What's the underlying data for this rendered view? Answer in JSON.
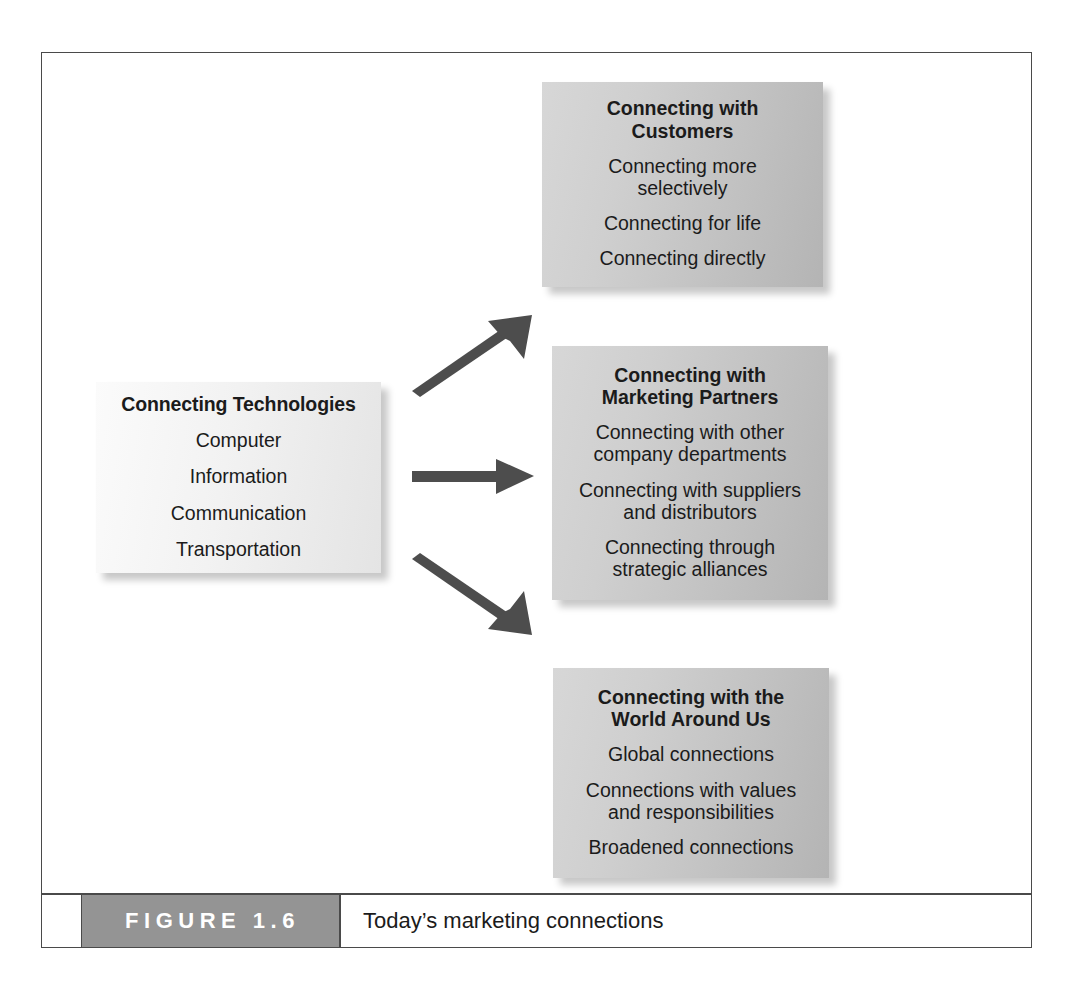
{
  "figure": {
    "badge_label": "FIGURE 1.6",
    "caption": "Today’s marketing connections",
    "badge_color": "#949494",
    "frame_color": "#4a4a4a"
  },
  "diagram": {
    "type": "flow",
    "source": {
      "title": "Connecting Technologies",
      "items": [
        "Computer",
        "Information",
        "Communication",
        "Transportation"
      ]
    },
    "arrows": [
      {
        "name": "arrow-to-customers",
        "direction": "up-right"
      },
      {
        "name": "arrow-to-marketing-partners",
        "direction": "right"
      },
      {
        "name": "arrow-to-world-around-us",
        "direction": "down-right"
      }
    ],
    "targets": [
      {
        "title": "Connecting with\nCustomers",
        "items": [
          "Connecting more\nselectively",
          "Connecting for life",
          "Connecting directly"
        ]
      },
      {
        "title": "Connecting with\nMarketing Partners",
        "items": [
          "Connecting with other\ncompany departments",
          "Connecting with suppliers\nand distributors",
          "Connecting through\nstrategic alliances"
        ]
      },
      {
        "title": "Connecting with the\nWorld Around Us",
        "items": [
          "Global connections",
          "Connections with values\nand responsibilities",
          "Broadened connections"
        ]
      }
    ]
  }
}
